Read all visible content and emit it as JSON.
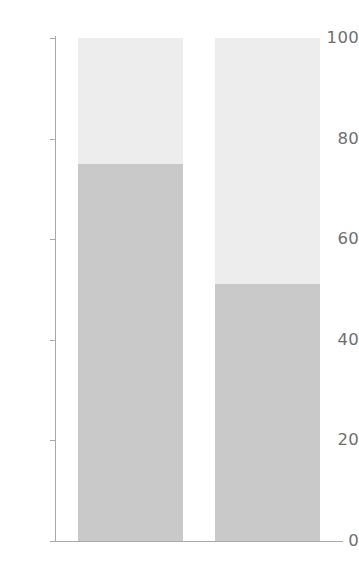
{
  "chart_data": {
    "type": "bar",
    "subtype": "stacked-bar-100-percent",
    "title": "",
    "subtitle": "",
    "xlabel": "",
    "ylabel": "",
    "ylim": [
      0,
      100
    ],
    "xlim": [
      0,
      2
    ],
    "grid": false,
    "legend": "none",
    "orientation": "vertical",
    "stacked": true,
    "categories": [
      "",
      ""
    ],
    "x_tick_labels": [],
    "y_ticks": [
      0,
      20,
      40,
      60,
      80,
      100
    ],
    "y_tick_labels": [
      "0",
      "20",
      "40",
      "60",
      "80",
      "100"
    ],
    "series": [
      {
        "name": "lower",
        "color": "#c9c9c9",
        "values": [
          75,
          51
        ]
      },
      {
        "name": "upper",
        "color": "#ededed",
        "values": [
          25,
          49
        ]
      }
    ],
    "annotations": [],
    "axis_color": "#a8a8a8",
    "tick_label_color": "#6f6f6f",
    "background_color": "#ffffff"
  },
  "axis": {
    "y_tick_labels": [
      "100",
      "80",
      "60",
      "40",
      "20",
      "0"
    ]
  }
}
